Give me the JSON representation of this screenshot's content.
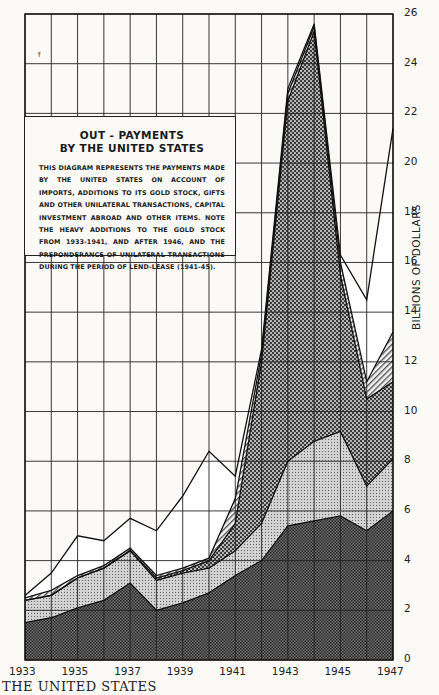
{
  "legend": {
    "title_line1": "OUT - PAYMENTS",
    "title_line2": "BY THE UNITED STATES",
    "body": "THIS DIAGRAM REPRESENTS THE PAYMENTS MADE BY THE UNITED STATES ON ACCOUNT OF IMPORTS, ADDITIONS TO ITS GOLD STOCK, GIFTS AND OTHER UNILATERAL TRANSACTIONS, CAPITAL INVESTMENT ABROAD AND OTHER ITEMS. NOTE THE HEAVY ADDITIONS TO THE GOLD STOCK FROM 1933-1941, AND AFTER 1946, AND THE PREPONDERANCE OF UNILATERAL TRANSACTIONS DURING THE PERIOD OF LEND-LEASE (1941-45)."
  },
  "footer": {
    "running_head": "THE UNITED STATES"
  },
  "stray_mark": "f",
  "axis": {
    "ylabel": "BILLIONS OF DOLLARS",
    "yticks": [
      "0",
      "2",
      "4",
      "6",
      "8",
      "10",
      "12",
      "14",
      "16",
      "18",
      "20",
      "22",
      "24",
      "26"
    ],
    "xticks": [
      "1933",
      "1935",
      "1937",
      "1939",
      "1941",
      "1943",
      "1945",
      "1947"
    ]
  },
  "colors": {
    "background": "#fbfaf7",
    "ink": "#1a1a1a",
    "imports_fill": "#555555",
    "services_fill": "#bdbdbd",
    "unilateral_fill": "#7a7a7a",
    "capital_fill": "#d9d9d9",
    "gold_fill": "#ffffff"
  },
  "chart_data": {
    "type": "area",
    "stacked": true,
    "xlabel": "",
    "ylabel": "BILLIONS OF DOLLARS",
    "x": [
      1933,
      1934,
      1935,
      1936,
      1937,
      1938,
      1939,
      1940,
      1941,
      1942,
      1943,
      1944,
      1945,
      1946,
      1947
    ],
    "ylim": [
      0,
      26
    ],
    "grid": true,
    "yaxis_position": "right",
    "series_cumulative_tops": [
      {
        "name": "Imports (dark fill)",
        "values": [
          1.5,
          1.7,
          2.1,
          2.4,
          3.1,
          2.0,
          2.3,
          2.7,
          3.4,
          4.0,
          5.4,
          5.6,
          5.8,
          5.2,
          6.0
        ]
      },
      {
        "name": "Other items (light dotted)",
        "values": [
          2.4,
          2.6,
          3.3,
          3.7,
          4.4,
          3.2,
          3.5,
          3.7,
          4.4,
          5.5,
          8.0,
          8.8,
          9.2,
          7.0,
          8.1
        ]
      },
      {
        "name": "Unilateral transactions (checker)",
        "values": [
          2.4,
          2.6,
          3.3,
          3.7,
          4.4,
          3.3,
          3.6,
          4.0,
          5.5,
          12.0,
          22.5,
          25.3,
          15.5,
          10.5,
          11.2
        ]
      },
      {
        "name": "Capital investment abroad (hatched)",
        "values": [
          2.5,
          2.8,
          3.4,
          3.8,
          4.5,
          3.4,
          3.7,
          4.1,
          6.5,
          12.3,
          22.8,
          25.5,
          16.0,
          11.2,
          13.2
        ]
      },
      {
        "name": "Additions to gold stock (white)",
        "values": [
          2.6,
          3.5,
          5.0,
          4.8,
          5.7,
          5.2,
          6.6,
          8.4,
          7.4,
          12.5,
          23.0,
          25.6,
          16.3,
          14.5,
          21.4
        ]
      }
    ],
    "legend_position": "inset upper-left text box"
  }
}
